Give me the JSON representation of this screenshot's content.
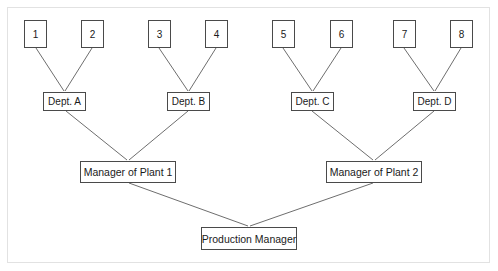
{
  "diagram": {
    "line_color": "#6e6e6e",
    "box_border_color": "#4a4a4a",
    "frame_color": "#e2e2e2",
    "background_color": "#ffffff",
    "leaves": [
      {
        "label": "1",
        "x": 24,
        "y": 20,
        "w": 23,
        "h": 28
      },
      {
        "label": "2",
        "x": 81,
        "y": 20,
        "w": 23,
        "h": 28
      },
      {
        "label": "3",
        "x": 148,
        "y": 20,
        "w": 23,
        "h": 28
      },
      {
        "label": "4",
        "x": 205,
        "y": 20,
        "w": 23,
        "h": 28
      },
      {
        "label": "5",
        "x": 272,
        "y": 20,
        "w": 23,
        "h": 28
      },
      {
        "label": "6",
        "x": 330,
        "y": 20,
        "w": 23,
        "h": 28
      },
      {
        "label": "7",
        "x": 393,
        "y": 20,
        "w": 23,
        "h": 28
      },
      {
        "label": "8",
        "x": 450,
        "y": 20,
        "w": 23,
        "h": 28
      }
    ],
    "departments": [
      {
        "label": "Dept. A",
        "x": 43,
        "y": 92,
        "w": 43,
        "h": 19
      },
      {
        "label": "Dept. B",
        "x": 167,
        "y": 92,
        "w": 43,
        "h": 19
      },
      {
        "label": "Dept. C",
        "x": 291,
        "y": 92,
        "w": 43,
        "h": 19
      },
      {
        "label": "Dept. D",
        "x": 413,
        "y": 92,
        "w": 43,
        "h": 19
      }
    ],
    "managers": [
      {
        "label": "Manager of Plant 1",
        "x": 80,
        "y": 161,
        "w": 96,
        "h": 22
      },
      {
        "label": "Manager of Plant 2",
        "x": 326,
        "y": 161,
        "w": 96,
        "h": 22
      }
    ],
    "top": {
      "label": "Production Manager",
      "x": 201,
      "y": 227,
      "w": 96,
      "h": 23
    },
    "edges": [
      {
        "from": "1",
        "to": "Dept. A",
        "x1": 36,
        "y1": 48,
        "x2": 64,
        "y2": 91
      },
      {
        "from": "2",
        "to": "Dept. A",
        "x1": 92,
        "y1": 48,
        "x2": 65,
        "y2": 91
      },
      {
        "from": "3",
        "to": "Dept. B",
        "x1": 159,
        "y1": 48,
        "x2": 188,
        "y2": 91
      },
      {
        "from": "4",
        "to": "Dept. B",
        "x1": 216,
        "y1": 48,
        "x2": 189,
        "y2": 91
      },
      {
        "from": "5",
        "to": "Dept. C",
        "x1": 283,
        "y1": 48,
        "x2": 312,
        "y2": 91
      },
      {
        "from": "6",
        "to": "Dept. C",
        "x1": 341,
        "y1": 48,
        "x2": 313,
        "y2": 91
      },
      {
        "from": "7",
        "to": "Dept. D",
        "x1": 404,
        "y1": 48,
        "x2": 434,
        "y2": 91
      },
      {
        "from": "8",
        "to": "Dept. D",
        "x1": 461,
        "y1": 48,
        "x2": 435,
        "y2": 91
      },
      {
        "from": "Dept. A",
        "to": "Manager of Plant 1",
        "x1": 66,
        "y1": 111,
        "x2": 127,
        "y2": 160
      },
      {
        "from": "Dept. B",
        "to": "Manager of Plant 1",
        "x1": 188,
        "y1": 111,
        "x2": 129,
        "y2": 160
      },
      {
        "from": "Dept. C",
        "to": "Manager of Plant 2",
        "x1": 312,
        "y1": 111,
        "x2": 373,
        "y2": 160
      },
      {
        "from": "Dept. D",
        "to": "Manager of Plant 2",
        "x1": 434,
        "y1": 111,
        "x2": 375,
        "y2": 160
      },
      {
        "from": "Manager of Plant 1",
        "to": "Production Manager",
        "x1": 129,
        "y1": 183,
        "x2": 248,
        "y2": 226
      },
      {
        "from": "Manager of Plant 2",
        "to": "Production Manager",
        "x1": 373,
        "y1": 183,
        "x2": 250,
        "y2": 226
      }
    ]
  }
}
